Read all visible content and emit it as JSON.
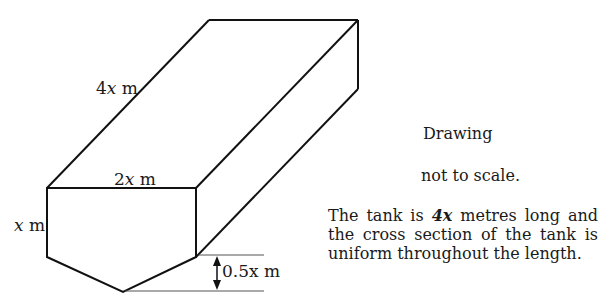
{
  "diagram": {
    "type": "tank-prism",
    "labels": {
      "length": {
        "num": "4",
        "var": "x",
        "unit": " m"
      },
      "width": {
        "num": "2",
        "var": "x",
        "unit": " m"
      },
      "height": {
        "num": "",
        "var": "x",
        "unit": " m"
      },
      "depth": {
        "text": "0.5x m"
      }
    },
    "colors": {
      "stroke": "#111111",
      "text": "#1a1a1a",
      "background": "#ffffff"
    }
  },
  "notes": {
    "drawing": "Drawing",
    "scale": "not to scale.",
    "desc_before": "The tank is ",
    "desc_bold": "4x",
    "desc_after": " metres long and the cross section of the tank  is uniform throughout the length."
  }
}
